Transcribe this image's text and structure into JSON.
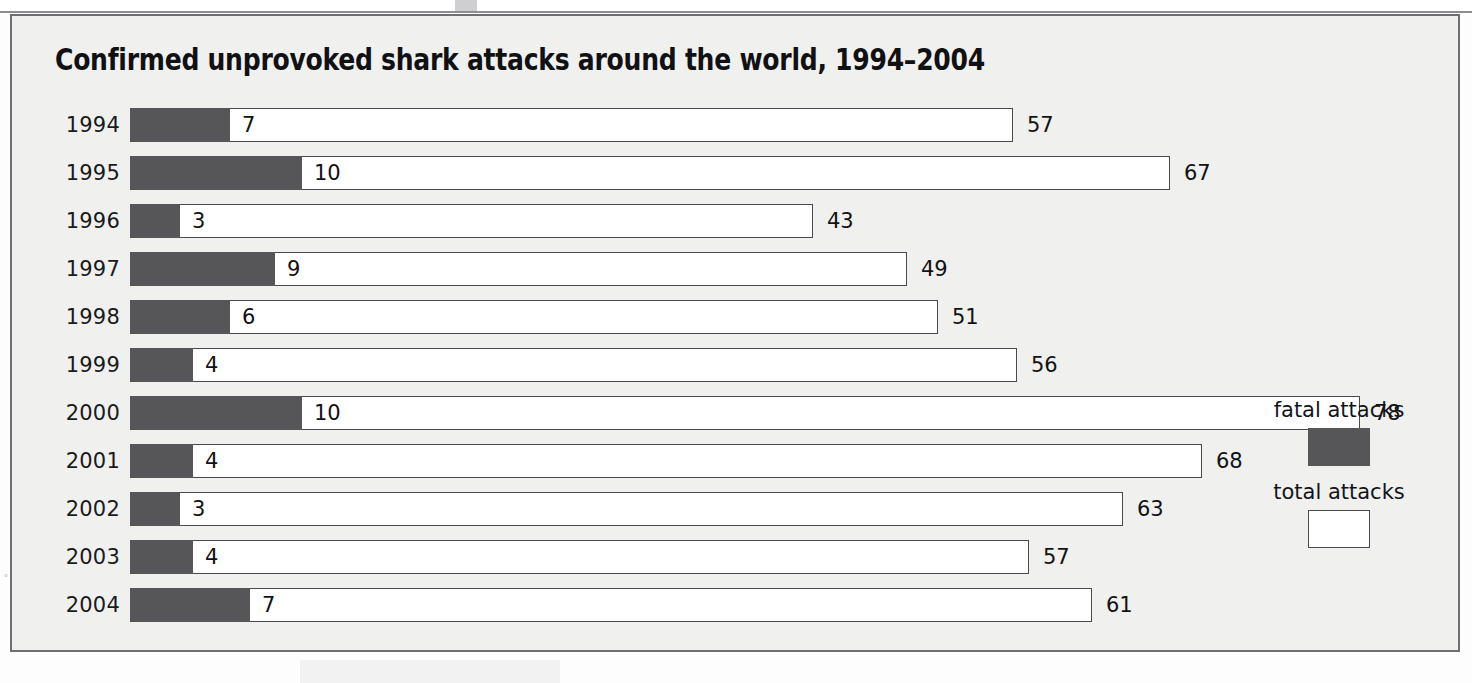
{
  "chart_data": {
    "type": "bar",
    "title": "Confirmed unprovoked shark attacks around the world, 1994–2004",
    "orientation": "horizontal",
    "stacked_overlay": true,
    "xlabel": "",
    "ylabel": "",
    "grid": false,
    "xlim": [
      0,
      84
    ],
    "categories": [
      "1994",
      "1995",
      "1996",
      "1997",
      "1998",
      "1999",
      "2000",
      "2001",
      "2002",
      "2003",
      "2004"
    ],
    "series": [
      {
        "name": "fatal attacks",
        "color": "#565659",
        "values": [
          7,
          10,
          3,
          9,
          6,
          4,
          10,
          4,
          3,
          4,
          7
        ]
      },
      {
        "name": "total attacks",
        "color": "#ffffff",
        "values": [
          57,
          67,
          43,
          49,
          51,
          56,
          78,
          68,
          63,
          57,
          61
        ]
      }
    ],
    "legend": {
      "position": "right",
      "entries": [
        {
          "label": "fatal attacks",
          "swatch": "dark-gray-swatch",
          "color": "#565659"
        },
        {
          "label": "total attacks",
          "swatch": "white-swatch",
          "color": "#ffffff"
        }
      ]
    }
  },
  "rows": [
    {
      "year": "1994",
      "fatal": "7",
      "total": "57",
      "fatal_px": 100,
      "total_px": 883
    },
    {
      "year": "1995",
      "fatal": "10",
      "total": "67",
      "fatal_px": 172,
      "total_px": 1040
    },
    {
      "year": "1996",
      "fatal": "3",
      "total": "43",
      "fatal_px": 50,
      "total_px": 683
    },
    {
      "year": "1997",
      "fatal": "9",
      "total": "49",
      "fatal_px": 145,
      "total_px": 777
    },
    {
      "year": "1998",
      "fatal": "6",
      "total": "51",
      "fatal_px": 100,
      "total_px": 808
    },
    {
      "year": "1999",
      "fatal": "4",
      "total": "56",
      "fatal_px": 63,
      "total_px": 887
    },
    {
      "year": "2000",
      "fatal": "10",
      "total": "78",
      "fatal_px": 172,
      "total_px": 1230
    },
    {
      "year": "2001",
      "fatal": "4",
      "total": "68",
      "fatal_px": 63,
      "total_px": 1072
    },
    {
      "year": "2002",
      "fatal": "3",
      "total": "63",
      "fatal_px": 50,
      "total_px": 993
    },
    {
      "year": "2003",
      "fatal": "4",
      "total": "57",
      "fatal_px": 63,
      "total_px": 899
    },
    {
      "year": "2004",
      "fatal": "7",
      "total": "61",
      "fatal_px": 120,
      "total_px": 962
    }
  ],
  "scan": {
    "left_edge_marks": "°"
  },
  "colors": {
    "fatal": "#565659",
    "total": "#ffffff",
    "background": "#f0f0ef",
    "frame_border": "#6f6f73",
    "text": "#111114"
  }
}
